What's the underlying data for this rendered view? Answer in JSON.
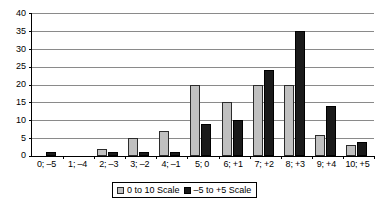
{
  "chart_data": {
    "type": "bar",
    "title": "",
    "subtitle": "",
    "xlabel": "",
    "ylabel": "",
    "ylim": [
      0,
      40
    ],
    "ytick_step": 5,
    "yticks": [
      0,
      5,
      10,
      15,
      20,
      25,
      30,
      35,
      40
    ],
    "grid": true,
    "legend_position": "bottom-center",
    "categories": [
      "0; –5",
      "1; –4",
      "2; –3",
      "3; –2",
      "4; –1",
      "5; 0",
      "6; +1",
      "7; +2",
      "8; +3",
      "9; +4",
      "10; +5"
    ],
    "series": [
      {
        "name": "0 to 10 Scale",
        "color": "#c0c0c0",
        "values": [
          0,
          0,
          2,
          5,
          7,
          20,
          15,
          20,
          20,
          6,
          3
        ]
      },
      {
        "name": "–5 to +5 Scale",
        "color": "#1a1a1a",
        "values": [
          1,
          0,
          1,
          1,
          1,
          9,
          10,
          24,
          35,
          14,
          4
        ]
      }
    ]
  },
  "legend": {
    "entries": [
      {
        "label": "0 to 10 Scale"
      },
      {
        "label": "–5 to +5 Scale"
      }
    ]
  }
}
